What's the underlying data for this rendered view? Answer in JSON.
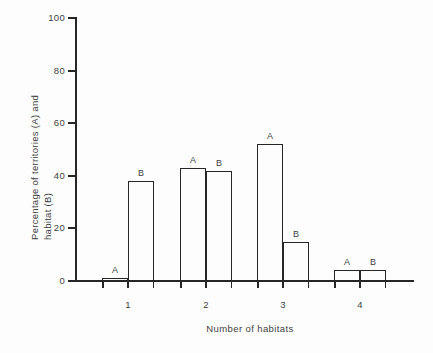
{
  "figure": {
    "xlabel": "Number of habitats",
    "ylabel_line1": "Percentage of territories (A) and",
    "ylabel_line2": "habitat (B)"
  },
  "chart_data": {
    "type": "bar",
    "title": "",
    "xlabel": "Number of habitats",
    "ylabel": "Percentage of territories (A) and habitat (B)",
    "categories": [
      "1",
      "2",
      "3",
      "4"
    ],
    "series": [
      {
        "name": "A",
        "values": [
          1,
          43,
          52,
          4
        ]
      },
      {
        "name": "B",
        "values": [
          38,
          42,
          15,
          4
        ]
      }
    ],
    "ylim": [
      0,
      100
    ],
    "yticks": [
      0,
      20,
      40,
      60,
      80,
      100
    ],
    "grid": false,
    "legend": "none",
    "bar_value_labels": "series letter above each bar",
    "bar_fill": "#fdfdfd",
    "axis_color": "#262626",
    "text_color": "#3f3f3f",
    "background": "#fdfdfd"
  }
}
